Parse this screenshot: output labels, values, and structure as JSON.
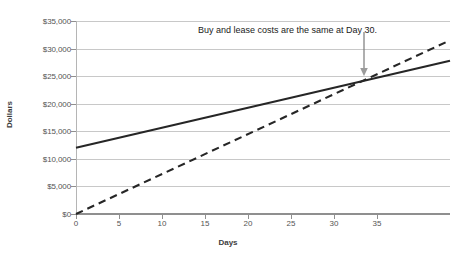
{
  "chart_data": {
    "type": "line",
    "title": "",
    "xlabel": "Days",
    "ylabel": "Dollars",
    "xlim": [
      0,
      39
    ],
    "ylim": [
      0,
      35000
    ],
    "grid": true,
    "legend": "none",
    "x_ticks": [
      0,
      5,
      10,
      15,
      20,
      25,
      30,
      35
    ],
    "x_tick_labels": [
      "0",
      "5",
      "10",
      "15",
      "20",
      "25",
      "30",
      "35"
    ],
    "y_ticks": [
      0,
      5000,
      10000,
      15000,
      20000,
      25000,
      30000,
      35000
    ],
    "y_tick_labels": [
      "$0",
      "$5,000",
      "$10,000",
      "$15,000",
      "$20,000",
      "$25,000",
      "$30,000",
      "$35,000"
    ],
    "series": [
      {
        "name": "Buy",
        "style": "solid",
        "color": "#262626",
        "x": [
          0,
          39
        ],
        "values": [
          12000,
          27800
        ]
      },
      {
        "name": "Lease",
        "style": "dashed",
        "color": "#262626",
        "x": [
          0,
          39
        ],
        "values": [
          0,
          31500
        ]
      }
    ],
    "annotations": [
      {
        "text": "Buy and lease costs are the same at Day 30.",
        "arrow_from_x": 30,
        "arrow_from_y": 33000,
        "arrow_to_x": 30,
        "arrow_to_y": 25000
      }
    ]
  },
  "colors": {
    "gridline": "#c8c8c8",
    "axis": "#8f8f8f",
    "tick_text": "#545454",
    "series_line": "#262626",
    "annotation_text": "#1a1a1a",
    "background": "#ffffff"
  }
}
